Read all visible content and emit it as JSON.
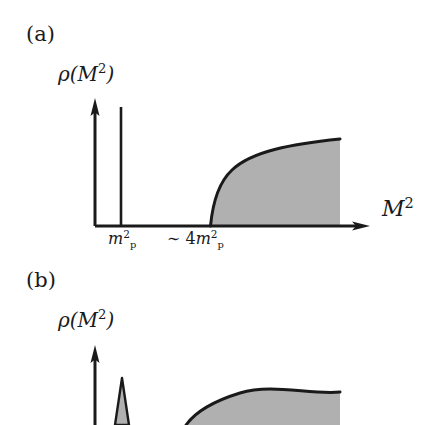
{
  "figure": {
    "background_color": "#ffffff",
    "ink_color": "#1a1a1a",
    "fill_color": "#b0b0b0",
    "panels": [
      {
        "id": "a",
        "label": "(a)",
        "y_axis_label_rho": "ρ(",
        "y_axis_label_var": "M",
        "y_axis_label_exp": "2",
        "y_axis_label_close": ")",
        "x_axis_label_var": "M",
        "x_axis_label_exp": "2",
        "ticks": [
          {
            "name": "pole-mass",
            "prefix": "",
            "coefficient": "",
            "symbol": "m",
            "superscript": "2",
            "subscript": "p",
            "x_px": 121
          },
          {
            "name": "continuum-threshold",
            "prefix": "∼ ",
            "coefficient": "4",
            "symbol": "m",
            "superscript": "2",
            "subscript": "p",
            "x_px": 210
          }
        ],
        "features": {
          "delta_spike": {
            "type": "delta-function",
            "x_px": 121,
            "top_y_px": 107,
            "base_y_px": 226
          },
          "continuum": {
            "type": "shaded-continuum",
            "start_x_px": 210,
            "end_x_px": 340,
            "top_y_px": 139,
            "base_y_px": 226
          }
        },
        "axes": {
          "origin_x_px": 95,
          "baseline_y_px": 226,
          "y_axis_top_y_px": 100,
          "x_axis_end_x_px": 368
        }
      },
      {
        "id": "b",
        "label": "(b)",
        "y_axis_label_rho": "ρ(",
        "y_axis_label_var": "M",
        "y_axis_label_exp": "2",
        "y_axis_label_close": ")",
        "features": {
          "resonance_peak": {
            "type": "broadened-resonance",
            "x_px": 122,
            "top_y_px": 378,
            "half_width_px": 7
          },
          "continuum": {
            "type": "shaded-continuum",
            "start_x_px": 205,
            "end_x_px": 340,
            "top_y_px": 392
          }
        },
        "axes": {
          "origin_x_px": 95,
          "y_axis_top_y_px": 345
        },
        "cropped_at_bottom": true
      }
    ]
  }
}
